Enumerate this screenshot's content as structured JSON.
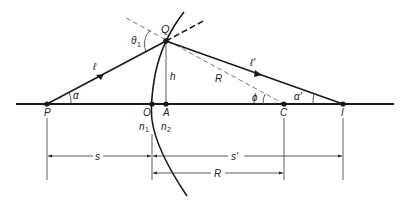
{
  "diagram": {
    "colors": {
      "ink": "#1a1a1a",
      "thin": "#333333",
      "dashed": "#555555",
      "background": "#ffffff"
    },
    "points": {
      "P": {
        "label": "P",
        "x": 47,
        "y": 104
      },
      "O": {
        "label": "O",
        "x": 152,
        "y": 104
      },
      "A": {
        "label": "A",
        "x": 166,
        "y": 104
      },
      "C": {
        "label": "C",
        "x": 284,
        "y": 104
      },
      "I": {
        "label": "I",
        "x": 343,
        "y": 104
      },
      "Q": {
        "label": "Q",
        "x": 166,
        "y": 41
      }
    },
    "labels": {
      "Q": "Q",
      "theta1": "θ",
      "theta1_sub": "1",
      "ell": "ℓ",
      "ell_prime": "ℓ'",
      "h": "h",
      "R_radius": "R",
      "phi": "ϕ",
      "alpha": "α",
      "alpha_prime": "α'",
      "P": "P",
      "O": "O",
      "A": "A",
      "C": "C",
      "I": "I",
      "n1": "n",
      "n1_sub": "1",
      "n2": "n",
      "n2_sub": "2",
      "s": "s",
      "s_prime": "s'",
      "R_dim": "R"
    }
  }
}
